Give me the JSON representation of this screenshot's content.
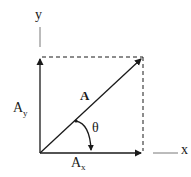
{
  "diagram": {
    "title": "",
    "labels": {
      "y_axis": "y",
      "x_axis": "x",
      "vector": "A",
      "y_component": "A",
      "y_component_sub": "y",
      "x_component": "A",
      "x_component_sub": "x",
      "angle": "θ"
    },
    "colors": {
      "stroke": "#1a1a1a",
      "background": "#ffffff"
    }
  }
}
